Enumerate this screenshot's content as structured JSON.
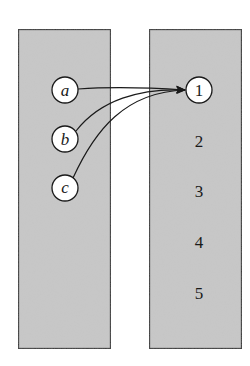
{
  "diagram": {
    "type": "mapping",
    "colors": {
      "box_fill": "#c8c8c8",
      "box_stroke": "#333333",
      "circle_fill": "#ffffff",
      "line": "#1a1a1a",
      "background": "#ffffff"
    },
    "left_set": {
      "elements": [
        {
          "label": "a",
          "circled": true
        },
        {
          "label": "b",
          "circled": true
        },
        {
          "label": "c",
          "circled": true
        }
      ]
    },
    "right_set": {
      "elements": [
        {
          "label": "1",
          "circled": true
        },
        {
          "label": "2",
          "circled": false
        },
        {
          "label": "3",
          "circled": false
        },
        {
          "label": "4",
          "circled": false
        },
        {
          "label": "5",
          "circled": false
        }
      ]
    },
    "edges": [
      {
        "from": "a",
        "to": "1"
      },
      {
        "from": "b",
        "to": "1"
      },
      {
        "from": "c",
        "to": "1"
      }
    ]
  }
}
